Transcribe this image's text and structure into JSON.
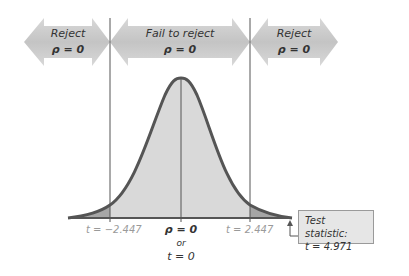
{
  "regions": {
    "left": {
      "line1": "Reject",
      "line2": "ρ = 0"
    },
    "middle": {
      "line1": "Fail to reject",
      "line2": "ρ = 0"
    },
    "right": {
      "line1": "Reject",
      "line2": "ρ = 0"
    }
  },
  "axis": {
    "left_critical": "t = −2.447",
    "right_critical": "t = 2.447",
    "center_line1": "ρ = 0",
    "center_or": "or",
    "center_line3": "t = 0"
  },
  "test_statistic": {
    "label": "Test statistic:",
    "value": "t = 4.971"
  },
  "colors": {
    "arrow_fill": "#c8c8c8",
    "curve_stroke": "#555555",
    "center_fill": "#d9d9d9",
    "tail_fill": "#a6a6a6",
    "box_fill": "#e6e6e6"
  }
}
